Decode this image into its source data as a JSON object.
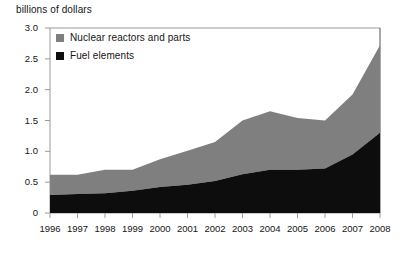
{
  "chart_data": {
    "type": "area",
    "stacked": true,
    "title": "billions of dollars",
    "xlabel": "",
    "ylabel": "billions of dollars",
    "categories": [
      "1996",
      "1997",
      "1998",
      "1999",
      "2000",
      "2001",
      "2002",
      "2003",
      "2004",
      "2005",
      "2006",
      "2007",
      "2008"
    ],
    "x": [
      1996,
      1997,
      1998,
      1999,
      2000,
      2001,
      2002,
      2003,
      2004,
      2005,
      2006,
      2007,
      2008
    ],
    "series": [
      {
        "name": "Fuel elements",
        "color": "#0d0d0d",
        "values": [
          0.29,
          0.31,
          0.32,
          0.36,
          0.42,
          0.46,
          0.52,
          0.63,
          0.7,
          0.7,
          0.72,
          0.95,
          1.3
        ]
      },
      {
        "name": "Nuclear reactors and parts",
        "color": "#7f7f7f",
        "values": [
          0.33,
          0.31,
          0.38,
          0.34,
          0.45,
          0.55,
          0.63,
          0.87,
          0.95,
          0.84,
          0.78,
          0.97,
          1.42
        ]
      }
    ],
    "totals": [
      0.62,
      0.62,
      0.7,
      0.7,
      0.87,
      1.01,
      1.15,
      1.5,
      1.65,
      1.54,
      1.5,
      1.92,
      2.72
    ],
    "ylim": [
      0,
      3.0
    ],
    "yticks": [
      0,
      0.5,
      1.0,
      1.5,
      2.0,
      2.5,
      3.0
    ],
    "ytick_labels": [
      "0",
      "0.5",
      "1.0",
      "1.5",
      "2.0",
      "2.5",
      "3.0"
    ],
    "xtick_labels": [
      "1996",
      "1997",
      "1998",
      "1999",
      "2000",
      "2001",
      "2002",
      "2003",
      "2004",
      "2005",
      "2006",
      "2007",
      "2008"
    ],
    "grid": false,
    "legend_position": "top-left",
    "legend": [
      {
        "label": "Nuclear reactors and parts",
        "swatch": "#7f7f7f"
      },
      {
        "label": "Fuel elements",
        "swatch": "#0d0d0d"
      }
    ]
  },
  "axis": {
    "unit_label": "billions of dollars"
  },
  "colors": {
    "reactors": "#7f7f7f",
    "fuel": "#0d0d0d",
    "axis_line": "#8c8c8c",
    "frame_line": "#3d3d3d"
  }
}
